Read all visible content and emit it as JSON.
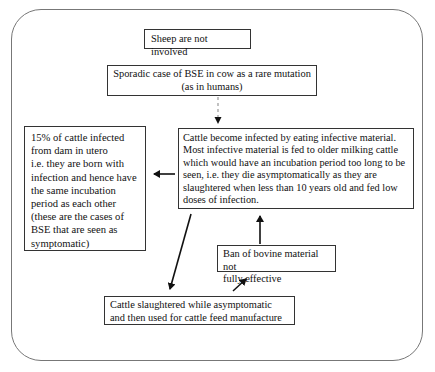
{
  "diagram": {
    "frame": "rounded-rectangle",
    "nodes": {
      "sheep": {
        "text": "Sheep are not involved"
      },
      "sporadic": {
        "text": "Sporadic case of BSE in cow as a rare mutation\n(as in humans)"
      },
      "in_utero": {
        "text": "15% of cattle infected\nfrom dam in utero\ni.e. they are born with\ninfection and hence have\nthe same incubation\nperiod as each other\n(these are  the cases of\nBSE that are seen as\nsymptomatic)"
      },
      "eating": {
        "text": "Cattle become infected by eating infective material.\nMost infective material is fed to older milking cattle\nwhich would have an incubation period too long to be\nseen, i.e. they die asymptomatically as they are\nslaughtered when less than 10 years old and fed low\ndoses of infection."
      },
      "ban": {
        "text": "Ban of bovine material not\nfully effective"
      },
      "slaughter": {
        "text": "Cattle slaughtered while asymptomatic\nand then used for cattle feed manufacture"
      }
    },
    "edges": [
      {
        "from": "sporadic",
        "to": "eating",
        "style": "dashed"
      },
      {
        "from": "eating",
        "to": "in_utero",
        "style": "solid"
      },
      {
        "from": "eating",
        "to": "slaughter",
        "style": "solid"
      },
      {
        "from": "slaughter",
        "to": "ban",
        "style": "solid"
      },
      {
        "from": "ban",
        "to": "eating",
        "style": "solid"
      }
    ],
    "colors": {
      "line": "#111111",
      "dashed": "#999999",
      "frame": "#777777"
    }
  }
}
